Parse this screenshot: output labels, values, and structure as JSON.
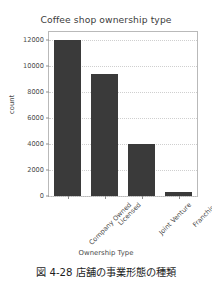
{
  "chart_data": {
    "type": "bar",
    "title": "Coffee shop ownership type",
    "xlabel": "Ownership Type",
    "ylabel": "count",
    "categories": [
      "Company Owned",
      "Licensed",
      "Joint Venture",
      "Franchise"
    ],
    "values": [
      12000,
      9400,
      4000,
      300
    ],
    "ylim": [
      0,
      12600
    ],
    "yticks": [
      0,
      2000,
      4000,
      6000,
      8000,
      10000,
      12000
    ],
    "ytick_labels": [
      "0",
      "2000",
      "4000",
      "6000",
      "8000",
      "10000",
      "12000"
    ],
    "grid": "horizontal-dotted",
    "legend": null,
    "bar_color": "#3a3a3a",
    "grid_color": "#cfcfcf",
    "axes_color": "#b9b9b9"
  },
  "caption": {
    "text": "図 4-28 店舗の事業形態の種類"
  }
}
